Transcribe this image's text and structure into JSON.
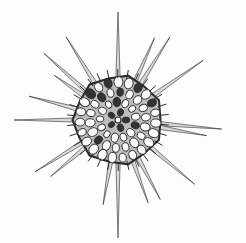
{
  "image": {
    "subject": "radiolarian illustration",
    "background": "#fdfdfd",
    "ink": "#2a2a2a",
    "center": [
      118,
      120
    ],
    "body_radius": 44,
    "spines": [
      {
        "angle": -90,
        "length": 108
      },
      {
        "angle": -122,
        "length": 98
      },
      {
        "angle": -138,
        "length": 100
      },
      {
        "angle": -145,
        "length": 78
      },
      {
        "angle": -165,
        "length": 92
      },
      {
        "angle": 180,
        "length": 104
      },
      {
        "angle": 148,
        "length": 98
      },
      {
        "angle": 140,
        "length": 88
      },
      {
        "angle": 100,
        "length": 86
      },
      {
        "angle": 90,
        "length": 118
      },
      {
        "angle": 70,
        "length": 88
      },
      {
        "angle": 62,
        "length": 90
      },
      {
        "angle": 40,
        "length": 100
      },
      {
        "angle": 5,
        "length": 104
      },
      {
        "angle": 10,
        "length": 90
      },
      {
        "angle": -35,
        "length": 104
      },
      {
        "angle": -58,
        "length": 98
      },
      {
        "angle": -66,
        "length": 90
      }
    ]
  }
}
